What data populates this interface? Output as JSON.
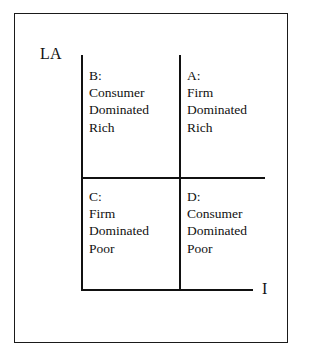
{
  "diagram": {
    "axes": {
      "y_label": "LA",
      "x_label": "I"
    },
    "quadrants": [
      {
        "id": "B",
        "position": "top-left",
        "key": "B:",
        "lines": [
          "B:",
          "Consumer",
          "Dominated",
          "Rich"
        ],
        "actor": "Consumer",
        "state": "Dominated",
        "wealth": "Rich"
      },
      {
        "id": "A",
        "position": "top-right",
        "key": "A:",
        "lines": [
          "A:",
          "Firm",
          "Dominated",
          "Rich"
        ],
        "actor": "Firm",
        "state": "Dominated",
        "wealth": "Rich"
      },
      {
        "id": "C",
        "position": "bottom-left",
        "key": "C:",
        "lines": [
          "C:",
          "Firm",
          "Dominated",
          "Poor"
        ],
        "actor": "Firm",
        "state": "Dominated",
        "wealth": "Poor"
      },
      {
        "id": "D",
        "position": "bottom-right",
        "key": "D:",
        "lines": [
          "D:",
          "Consumer",
          "Dominated",
          "Poor"
        ],
        "actor": "Consumer",
        "state": "Dominated",
        "wealth": "Poor"
      }
    ],
    "colors": {
      "ink": "#111111",
      "frame": "#1a1a1a",
      "background": "#ffffff"
    }
  }
}
